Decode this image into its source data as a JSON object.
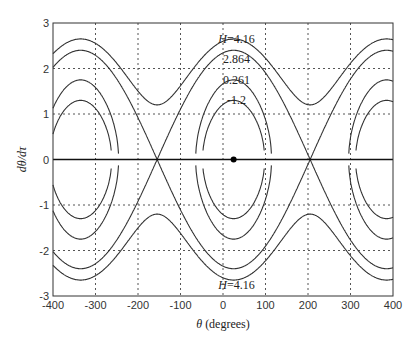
{
  "chart_data": {
    "type": "line",
    "title": "",
    "xlabel": "θ (degrees)",
    "ylabel": "dθ/dτ",
    "xlim": [
      -400,
      400
    ],
    "ylim": [
      -3,
      3
    ],
    "xticks": [
      -400,
      -300,
      -200,
      -100,
      0,
      100,
      200,
      300,
      400
    ],
    "yticks": [
      -3,
      -2,
      -1,
      0,
      1,
      2,
      3
    ],
    "grid": true,
    "equilibrium_point": {
      "x": 25,
      "y": 0
    },
    "separatrix_crossings": [
      -155,
      205
    ],
    "series": [
      {
        "name": "H=4.16",
        "peak": 2.65,
        "min": 1.2
      },
      {
        "name": "H=2.864",
        "peak": 2.4,
        "min": 0.0
      },
      {
        "name": "H=0.261",
        "peak": 1.75,
        "min": 0.0
      },
      {
        "name": "H=-1.2",
        "peak": 1.3,
        "min": 0.0
      }
    ],
    "annotations": [
      {
        "text": "H=4.16",
        "x": 20,
        "y": 2.65
      },
      {
        "text": "2.864",
        "x": 20,
        "y": 2.2
      },
      {
        "text": "0.261",
        "x": 20,
        "y": 1.75
      },
      {
        "text": "-1.2",
        "x": 20,
        "y": 1.3
      },
      {
        "text": "H=4.16",
        "x": 20,
        "y": -2.75
      }
    ]
  },
  "labels": {
    "xlabel": "θ (degrees)",
    "ylabel": "dθ/dτ"
  }
}
